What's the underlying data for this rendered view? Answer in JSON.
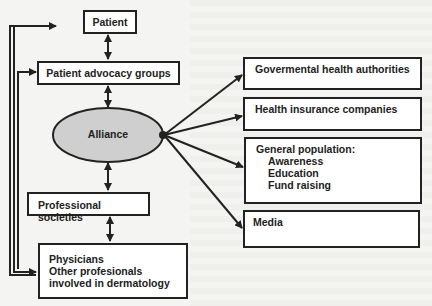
{
  "diagram": {
    "center": {
      "label": "Alliance",
      "fill": "#cfcfcf"
    },
    "left_chain": {
      "patient": "Patient",
      "advocacy": "Patient advocacy groups",
      "professional": "Professional societies",
      "physicians": {
        "line1": "Physicians",
        "line2": "Other profesionals",
        "line3": "involved in dermatology"
      }
    },
    "right_targets": {
      "governmental": "Govermental health authorities",
      "insurance": "Health insurance companies",
      "general": {
        "title": "General population:",
        "items": [
          "Awareness",
          "Education",
          "Fund raising"
        ]
      },
      "media": "Media"
    },
    "colors": {
      "stroke": "#222222",
      "box_fill": "#ffffff",
      "ellipse_fill": "#cfcfcf"
    }
  }
}
